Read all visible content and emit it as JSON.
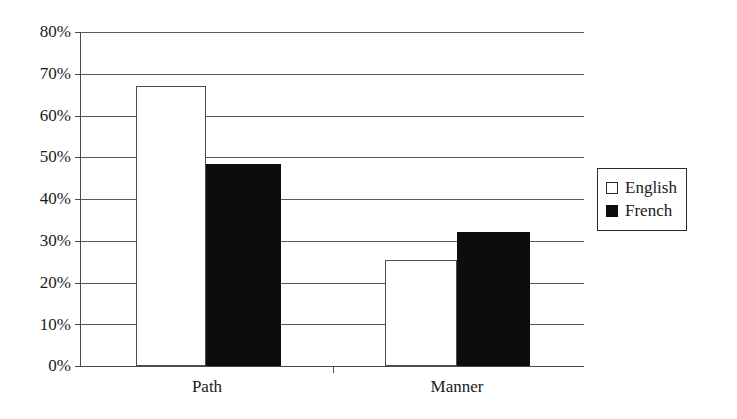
{
  "chart_data": {
    "type": "bar",
    "title": "",
    "subtitle": "",
    "xlabel": "",
    "ylabel": "",
    "categories": [
      "Path",
      "Manner"
    ],
    "series": [
      {
        "name": "English",
        "values": [
          67,
          25.3
        ],
        "color": "#ffffff",
        "edge_color": "#4d4d4d"
      },
      {
        "name": "French",
        "values": [
          48.5,
          32
        ],
        "color": "#0d0d0d",
        "edge_color": "#0d0d0d"
      }
    ],
    "ylim": [
      0,
      80
    ],
    "ytick_values": [
      0,
      10,
      20,
      30,
      40,
      50,
      60,
      70,
      80
    ],
    "ytick_labels": [
      "0%",
      "10%",
      "20%",
      "30%",
      "40%",
      "50%",
      "60%",
      "70%",
      "80%"
    ],
    "grid": "horizontal",
    "legend_position": "right",
    "legend_entries": [
      "English",
      "French"
    ],
    "value_format": "percent",
    "annotations": []
  },
  "axis": {
    "y_labels": [
      "80%",
      "70%",
      "60%",
      "50%",
      "40%",
      "30%",
      "20%",
      "10%",
      "0%"
    ],
    "x_labels": [
      "Path",
      "Manner"
    ]
  },
  "legend": {
    "items": [
      {
        "label": "English",
        "swatch": "open-square-swatch"
      },
      {
        "label": "French",
        "swatch": "filled-square-swatch"
      }
    ]
  }
}
